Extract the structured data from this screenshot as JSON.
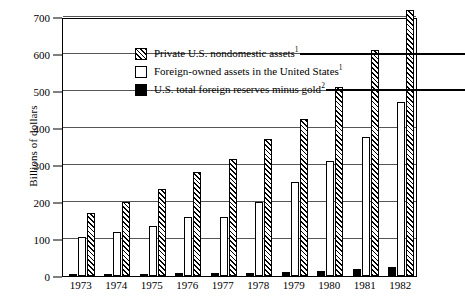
{
  "chart_data": {
    "type": "bar",
    "title": "",
    "xlabel": "",
    "ylabel": "Billions of dollars",
    "ylim": [
      0,
      700
    ],
    "yticks": [
      0,
      100,
      200,
      300,
      400,
      500,
      600,
      700
    ],
    "ytick_labels": [
      "0",
      "100",
      "200",
      "300",
      "400",
      "500",
      "600",
      "700"
    ],
    "grid": true,
    "legend_position": "upper-left-inside",
    "categories": [
      "1973",
      "1974",
      "1975",
      "1976",
      "1977",
      "1978",
      "1979",
      "1980",
      "1981",
      "1982"
    ],
    "series": [
      {
        "name": "U.S. total foreign reserves minus gold",
        "footnote": "2",
        "style": "solid-black",
        "values": [
          5,
          6,
          6,
          7,
          7,
          8,
          10,
          14,
          18,
          25
        ]
      },
      {
        "name": "Foreign-owned assets in the United States",
        "footnote": "1",
        "style": "open-white",
        "values": [
          105,
          120,
          135,
          160,
          160,
          200,
          255,
          310,
          375,
          470
        ]
      },
      {
        "name": "Private U.S. nondomestic assets",
        "footnote": "1",
        "style": "hatched",
        "values": [
          170,
          200,
          235,
          280,
          315,
          370,
          425,
          510,
          610,
          720
        ]
      }
    ]
  },
  "legend": {
    "items": [
      {
        "label": "Private U.S. nondomestic assets",
        "sup": "1",
        "swatch": "hatch",
        "rule": true
      },
      {
        "label": "Foreign-owned assets in the United States",
        "sup": "1",
        "swatch": "white",
        "rule": false
      },
      {
        "label": "U.S. total foreign reserves minus gold",
        "sup": "2",
        "swatch": "black",
        "rule": true
      }
    ]
  }
}
